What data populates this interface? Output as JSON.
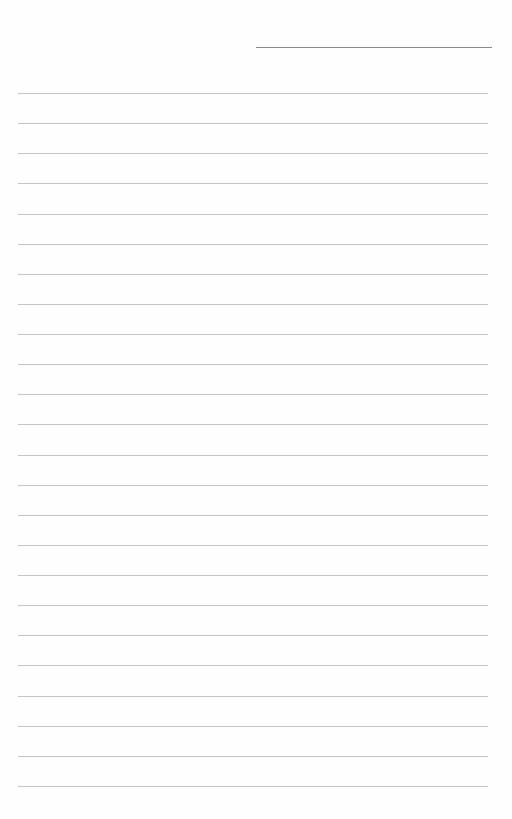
{
  "page": {
    "type": "lined notebook page",
    "background_color": "#fefefe",
    "header_line": {
      "color": "#8a8a8a",
      "x_start": 256,
      "x_end": 492,
      "y": 47
    },
    "ruled_lines": {
      "count": 24,
      "color": "#c4c4c4",
      "x_start": 18,
      "x_end": 488,
      "first_y": 93,
      "spacing": 30.13
    },
    "text": ""
  }
}
